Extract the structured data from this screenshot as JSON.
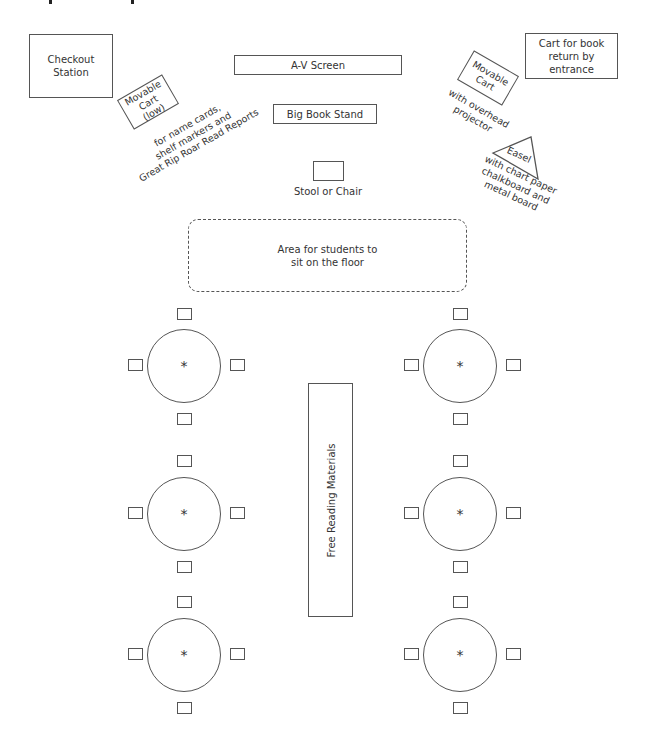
{
  "title_fragment": "",
  "fixtures": {
    "checkout_station": "Checkout Station",
    "av_screen": "A-V Screen",
    "big_book_stand": "Big Book Stand",
    "stool": "Stool or Chair",
    "book_return_cart": "Cart for book return by entrance",
    "movable_cart_low": {
      "label": "Movable Cart (low)",
      "note_lines": [
        "for name cards,",
        "shelf markers and",
        "Great Rip Roar Read Reports"
      ]
    },
    "movable_cart_projector": {
      "label": "Movable Cart",
      "note_lines": [
        "with overhead",
        "projector"
      ]
    },
    "easel": {
      "label": "Easel",
      "note_lines": [
        "with chart paper",
        "chalkboard and",
        "metal board"
      ]
    },
    "floor_area": "Area for students to sit on the floor",
    "free_reading": "Free Reading Materials"
  },
  "tables": [
    {
      "id": "left-1",
      "cx": 184,
      "cy": 366,
      "mark": "*"
    },
    {
      "id": "left-2",
      "cx": 184,
      "cy": 514,
      "mark": "*"
    },
    {
      "id": "left-3",
      "cx": 184,
      "cy": 655,
      "mark": "*"
    },
    {
      "id": "right-1",
      "cx": 460,
      "cy": 366,
      "mark": "*"
    },
    {
      "id": "right-2",
      "cx": 460,
      "cy": 514,
      "mark": "*"
    },
    {
      "id": "right-3",
      "cx": 460,
      "cy": 655,
      "mark": "*"
    }
  ],
  "colors": {
    "stroke": "#555555",
    "text": "#333333",
    "background": "#ffffff"
  }
}
